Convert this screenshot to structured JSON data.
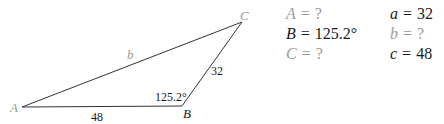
{
  "diagram": {
    "type": "triangle",
    "vertices": {
      "A": {
        "label": "A",
        "x": 22,
        "y": 107
      },
      "B": {
        "label": "B",
        "x": 182,
        "y": 106
      },
      "C": {
        "label": "C",
        "x": 242,
        "y": 22
      }
    },
    "side_labels": {
      "b": "b",
      "a": "32",
      "c": "48"
    },
    "angle_labels": {
      "B": "125.2°"
    },
    "colors": {
      "stroke": "#333333",
      "known_text": "#1a1a1a",
      "unknown_text": "#9a9a9a"
    }
  },
  "given": {
    "left": [
      {
        "var": "A",
        "eq": "=",
        "val": "?",
        "known": false
      },
      {
        "var": "B",
        "eq": "=",
        "val": "125.2°",
        "known": true
      },
      {
        "var": "C",
        "eq": "=",
        "val": "?",
        "known": false
      }
    ],
    "right": [
      {
        "var": "a",
        "eq": "=",
        "val": "32",
        "known": true
      },
      {
        "var": "b",
        "eq": "=",
        "val": "?",
        "known": false
      },
      {
        "var": "c",
        "eq": "=",
        "val": "48",
        "known": true
      }
    ]
  }
}
